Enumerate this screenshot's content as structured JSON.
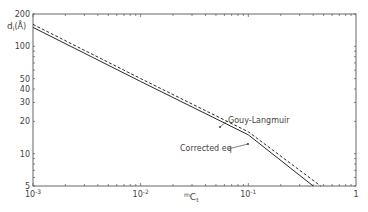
{
  "chart_data": {
    "type": "line",
    "title": "",
    "xlabel": "mCt",
    "xlabel_parts": {
      "pre_sup": "m",
      "main": "C",
      "sub": "t"
    },
    "ylabel": "d_i (Å)",
    "ylabel_parts": {
      "main": "d",
      "sub": "i",
      "unit": "(Å)"
    },
    "xscale": "log",
    "yscale": "log",
    "xlim": [
      0.001,
      1
    ],
    "ylim": [
      5,
      200
    ],
    "grid": false,
    "x_ticks": [
      {
        "value": 0.001,
        "label": "10",
        "exp": "-3"
      },
      {
        "value": 0.01,
        "label": "10",
        "exp": "-2"
      },
      {
        "value": 0.1,
        "label": "10",
        "exp": "-1"
      },
      {
        "value": 1,
        "label": "1",
        "exp": ""
      }
    ],
    "y_ticks": [
      {
        "value": 5,
        "label": "5"
      },
      {
        "value": 10,
        "label": "10"
      },
      {
        "value": 20,
        "label": "20"
      },
      {
        "value": 30,
        "label": "30"
      },
      {
        "value": 40,
        "label": "40"
      },
      {
        "value": 50,
        "label": "50"
      },
      {
        "value": 100,
        "label": "100"
      },
      {
        "value": 200,
        "label": "200"
      }
    ],
    "series": [
      {
        "name": "Corrected eq",
        "style": "solid",
        "x": [
          0.001,
          0.01,
          0.1,
          0.4
        ],
        "y": [
          150,
          47,
          15,
          5
        ]
      },
      {
        "name": "Gouy-Langmuir",
        "style": "dashed",
        "x": [
          0.001,
          0.01,
          0.1,
          0.47
        ],
        "y": [
          160,
          50,
          16,
          5
        ]
      }
    ],
    "annotations": [
      {
        "text": "Gouy-Langmuir",
        "target": "Gouy-Langmuir",
        "x": 228,
        "y": 123,
        "arrow_to": [
          220,
          127
        ]
      },
      {
        "text": "Corrected eq",
        "target": "Corrected eq",
        "x": 180,
        "y": 151,
        "arrow_to": [
          248,
          144
        ]
      }
    ],
    "legend": "none (inline annotations)"
  },
  "colors": {
    "line": "#2a2a2a",
    "axis": "#555555",
    "text": "#444444"
  }
}
